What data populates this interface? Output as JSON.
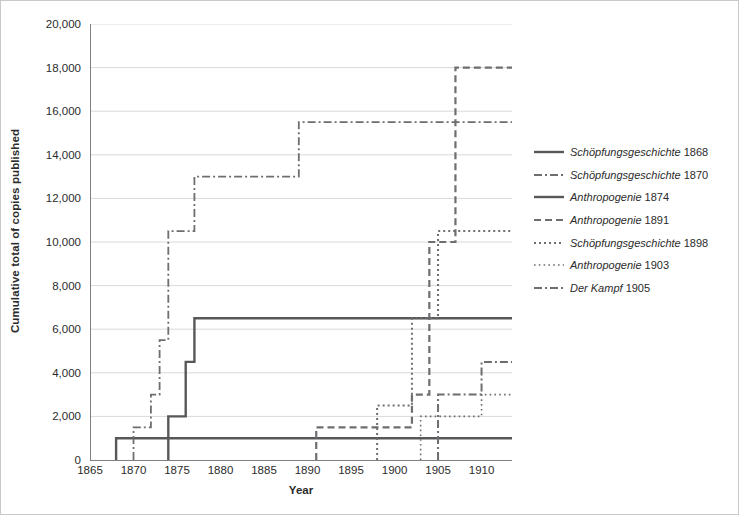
{
  "chart_data": {
    "type": "line",
    "title": "",
    "xlabel": "Year",
    "ylabel": "Cumulative total of copies published",
    "xlim": [
      1865,
      1913.5
    ],
    "ylim": [
      0,
      20000
    ],
    "xticks": [
      1865,
      1870,
      1875,
      1880,
      1885,
      1890,
      1895,
      1900,
      1905,
      1910
    ],
    "xtick_labels": [
      "1865",
      "1870",
      "1875",
      "1880",
      "1885",
      "1890",
      "1895",
      "1900",
      "1905",
      "1910"
    ],
    "yticks": [
      0,
      2000,
      4000,
      6000,
      8000,
      10000,
      12000,
      14000,
      16000,
      18000,
      20000
    ],
    "ytick_labels": [
      "0",
      "2,000",
      "4,000",
      "6,000",
      "8,000",
      "10,000",
      "12,000",
      "14,000",
      "16,000",
      "18,000",
      "20,000"
    ],
    "grid": "horizontal",
    "legend_position": "right",
    "drawstyle": "steps-post",
    "series": [
      {
        "name": "Schöpfungsgeschichte 1868",
        "title_italic": "Schöpfungsgeschichte",
        "year_label": "1868",
        "style": "solid",
        "width": 2.4,
        "color": "#58585a",
        "x": [
          1868,
          1868,
          1913.5
        ],
        "y": [
          0,
          1000,
          1000
        ]
      },
      {
        "name": "Schöpfungsgeschichte 1870",
        "title_italic": "Schöpfungsgeschichte",
        "year_label": "1870",
        "style": "dash-dot",
        "width": 1.8,
        "color": "#6d6e71",
        "x": [
          1870,
          1870,
          1872,
          1872,
          1873,
          1873,
          1874,
          1874,
          1877,
          1877,
          1879,
          1879,
          1889,
          1889,
          1913.5
        ],
        "y": [
          0,
          1500,
          1500,
          3000,
          3000,
          5500,
          5500,
          10500,
          10500,
          13000,
          13000,
          13000,
          13000,
          15500,
          15500
        ]
      },
      {
        "name": "Anthropogenie 1874",
        "title_italic": "Anthropogenie",
        "year_label": "1874",
        "style": "solid",
        "width": 2.4,
        "color": "#58585a",
        "x": [
          1874,
          1874,
          1876,
          1876,
          1877,
          1877,
          1913.5
        ],
        "y": [
          0,
          2000,
          2000,
          4500,
          4500,
          6500,
          6500
        ]
      },
      {
        "name": "Anthropogenie 1891",
        "title_italic": "Anthropogenie",
        "year_label": "1891",
        "style": "dashed",
        "width": 2.2,
        "color": "#6d6e71",
        "x": [
          1891,
          1891,
          1902,
          1902,
          1904,
          1904,
          1907,
          1907,
          1913.5
        ],
        "y": [
          0,
          1500,
          1500,
          3000,
          3000,
          10000,
          10000,
          18000,
          18000
        ]
      },
      {
        "name": "Schöpfungsgeschichte 1898",
        "title_italic": "Schöpfungsgeschichte",
        "year_label": "1898",
        "style": "dotted",
        "width": 2.0,
        "color": "#6d6e71",
        "x": [
          1898,
          1898,
          1902,
          1902,
          1905,
          1905,
          1913.5
        ],
        "y": [
          0,
          2500,
          2500,
          6500,
          6500,
          10500,
          10500
        ]
      },
      {
        "name": "Anthropogenie 1903",
        "title_italic": "Anthropogenie",
        "year_label": "1903",
        "style": "fine-dotted",
        "width": 1.6,
        "color": "#6d6e71",
        "x": [
          1903,
          1903,
          1910,
          1910,
          1913.5
        ],
        "y": [
          0,
          2000,
          2000,
          3000,
          3000
        ]
      },
      {
        "name": "Der Kampf 1905",
        "title_italic": "Der Kampf",
        "year_label": "1905",
        "style": "dash-dot",
        "width": 2.0,
        "color": "#6d6e71",
        "x": [
          1905,
          1905,
          1910,
          1910,
          1913.5
        ],
        "y": [
          0,
          3000,
          3000,
          4500,
          4500
        ]
      }
    ]
  },
  "axis": {
    "ylabel": "Cumulative total of copies published",
    "xlabel": "Year"
  },
  "colors": {
    "axis": "#808080",
    "grid": "#d9d9d9",
    "line_dark": "#58585a",
    "line_mid": "#6d6e71",
    "text": "#2b2b2b",
    "border": "#c9c9c9"
  }
}
